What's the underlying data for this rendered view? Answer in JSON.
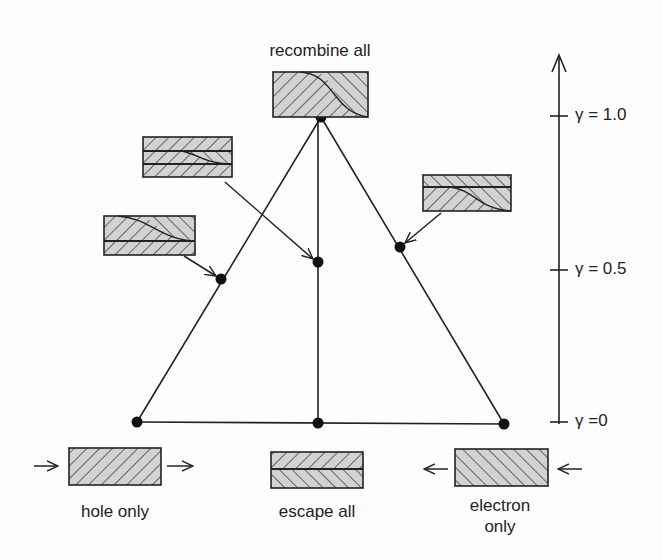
{
  "diagram": {
    "states": {
      "top": {
        "label": "recombine all"
      },
      "bottom_left": {
        "label": "hole only"
      },
      "bottom_center": {
        "label": "escape all"
      },
      "bottom_right": {
        "label_line1": "electron",
        "label_line2": "only"
      }
    },
    "axis": {
      "name": "gamma",
      "symbol": "γ",
      "ticks": [
        {
          "label": "γ = 1.0",
          "value": 1.0
        },
        {
          "label": "γ = 0.5",
          "value": 0.5
        },
        {
          "label": "γ =0",
          "value": 0
        }
      ]
    },
    "nodes": [
      {
        "id": "apex",
        "gamma": 1.0
      },
      {
        "id": "left-mid",
        "gamma": 0.5
      },
      {
        "id": "center",
        "gamma": 0.5
      },
      {
        "id": "right-mid",
        "gamma": 0.5
      },
      {
        "id": "bottom-left",
        "gamma": 0
      },
      {
        "id": "bottom-center",
        "gamma": 0
      },
      {
        "id": "bottom-right",
        "gamma": 0
      }
    ],
    "colors": {
      "line": "#222222",
      "hatch_fill": "#cfcfcf",
      "background": "#fdfdfd"
    }
  }
}
